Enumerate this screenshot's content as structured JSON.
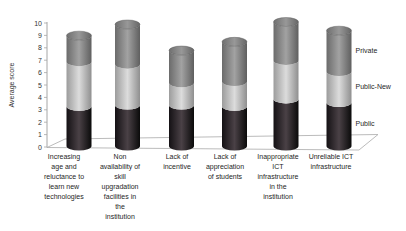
{
  "chart_data": {
    "type": "bar",
    "subtype": "3d-stacked-cylinder",
    "title": "",
    "xlabel": "",
    "ylabel": "Average score",
    "ylim": [
      0,
      10
    ],
    "ytick_step": 1,
    "grid": false,
    "legend_position": "right",
    "categories": [
      "Increasing age and reluctance to learn new technologies",
      "Non availability of skill upgradation facilities in the institution",
      "Lack of incentive",
      "Lack of appreciation of students",
      "Inappropriate ICT infrastructure in the institution",
      "Unreliable ICT infrastructure"
    ],
    "categories_lines": [
      [
        "Increasing",
        "age and",
        "reluctance to",
        "learn new",
        "technologies"
      ],
      [
        "Non",
        "availability of",
        "skill",
        "upgradation",
        "facilities in",
        "the",
        "institution"
      ],
      [
        "Lack of",
        "incentive"
      ],
      [
        "Lack of",
        "appreciation",
        "of students"
      ],
      [
        "Inappropriate",
        "ICT",
        "infrastructure",
        "in the",
        "institution"
      ],
      [
        "Unreliable ICT",
        "infrastructure"
      ]
    ],
    "series": [
      {
        "name": "Public",
        "values": [
          3.2,
          3.3,
          3.3,
          3.2,
          3.8,
          3.5
        ],
        "gradient": [
          "#141114",
          "#4a4146",
          "#0a0a0a"
        ]
      },
      {
        "name": "Public-New",
        "values": [
          3.6,
          3.3,
          1.8,
          2.0,
          3.1,
          2.5
        ],
        "gradient": [
          "#9c9c9c",
          "#dcdcdc",
          "#8f8f8f"
        ]
      },
      {
        "name": "Private",
        "values": [
          2.1,
          3.2,
          2.6,
          3.2,
          3.1,
          3.3
        ],
        "gradient": [
          "#6b6b6b",
          "#a2a2a2",
          "#5f5f5f"
        ]
      }
    ],
    "stack_totals": [
      8.9,
      9.8,
      7.7,
      8.4,
      10.0,
      9.3
    ],
    "cap_gradient": [
      "#6f6f6f",
      "#989898",
      "#666666"
    ],
    "colors": {
      "axis": "#a6a6a6",
      "floor_line": "#b3b3b3",
      "tick_text": "#333333",
      "label_text": "#262626",
      "background": "#ffffff"
    }
  }
}
